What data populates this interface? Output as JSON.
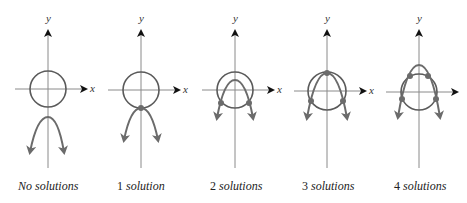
{
  "diagram": {
    "colors": {
      "axis": "#8a8a8a",
      "circle": "#5a5a5a",
      "parabola": "#6b6b6b",
      "point": "#6b6b6b",
      "arrowhead": "#111111"
    },
    "axis_labels": {
      "x": "x",
      "y": "y"
    },
    "panels": [
      {
        "id": "no-solutions",
        "num": "No",
        "word": "solutions",
        "caption_italic_all": true,
        "cx": 48,
        "cy": 89,
        "r": 18,
        "parabola": {
          "vx": 48,
          "vy": 117,
          "lx": 30,
          "ly": 152,
          "rx": 64,
          "ry": 152
        },
        "points": [],
        "x_label_visible": true
      },
      {
        "id": "one-solution",
        "num": "1",
        "word": "solution",
        "cx": 141,
        "cy": 90,
        "r": 18,
        "parabola": {
          "vx": 141,
          "vy": 108,
          "lx": 124,
          "ly": 140,
          "rx": 158,
          "ry": 140
        },
        "points": [
          [
            141,
            108
          ]
        ],
        "x_label_visible": true
      },
      {
        "id": "two-solutions",
        "num": "2",
        "word": "solutions",
        "cx": 235,
        "cy": 90,
        "r": 18,
        "parabola": {
          "vx": 235,
          "vy": 80,
          "lx": 217,
          "ly": 118,
          "rx": 253,
          "ry": 118
        },
        "points": [
          [
            221,
            103
          ],
          [
            249,
            103
          ]
        ],
        "x_label_visible": true
      },
      {
        "id": "three-solutions",
        "num": "3",
        "word": "solutions",
        "cx": 327,
        "cy": 91,
        "r": 19,
        "parabola": {
          "vx": 327,
          "vy": 73,
          "lx": 307,
          "ly": 118,
          "rx": 347,
          "ry": 118
        },
        "points": [
          [
            327,
            73
          ],
          [
            311,
            101
          ],
          [
            343,
            101
          ]
        ],
        "x_label_visible": true
      },
      {
        "id": "four-solutions",
        "num": "4",
        "word": "solutions",
        "cx": 419,
        "cy": 92,
        "r": 18,
        "parabola": {
          "vx": 419,
          "vy": 65,
          "lx": 398,
          "ly": 117,
          "rx": 440,
          "ry": 117
        },
        "points": [
          [
            410,
            76
          ],
          [
            428,
            76
          ],
          [
            402,
            99
          ],
          [
            436,
            99
          ]
        ],
        "x_label_visible": false
      }
    ],
    "captions": [
      {
        "num": "No",
        "word": "solutions",
        "x": 18
      },
      {
        "num": "1",
        "word": "solution",
        "x": 117
      },
      {
        "num": "2",
        "word": "solutions",
        "x": 210
      },
      {
        "num": "3",
        "word": "solutions",
        "x": 302
      },
      {
        "num": "4",
        "word": "solutions",
        "x": 394
      }
    ]
  }
}
